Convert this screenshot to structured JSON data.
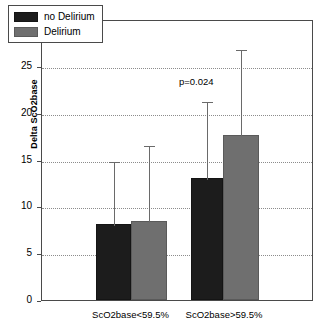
{
  "chart_data": {
    "type": "bar",
    "title": "",
    "xlabel": "",
    "ylabel": "Delta ScO2base",
    "ylim": [
      0,
      30
    ],
    "yticks": [
      0,
      5,
      10,
      15,
      20,
      25,
      30
    ],
    "grid": true,
    "legend_position": "top-left",
    "categories": [
      "ScO2base<59.5%",
      "ScO2base>59.5%"
    ],
    "series": [
      {
        "name": "no Delirium",
        "color": "#1c1c1c",
        "values": [
          8.1,
          13.0
        ],
        "errors_upper": [
          14.9,
          21.4
        ]
      },
      {
        "name": "Delirium",
        "color": "#6f6f6f",
        "values": [
          8.4,
          17.6
        ],
        "errors_upper": [
          16.7,
          26.9
        ]
      }
    ],
    "annotations": [
      {
        "text": "p=0.024",
        "x_category": "ScO2base>59.5%",
        "y": 23.5
      }
    ]
  },
  "axis": {
    "y_tick_labels": [
      "0",
      "5",
      "10",
      "15",
      "20",
      "25",
      "30"
    ],
    "y_title": "Delta ScO2base"
  },
  "legend": {
    "items": [
      {
        "label": "no Delirium",
        "swatch": "dark"
      },
      {
        "label": "Delirium",
        "swatch": "gray"
      }
    ]
  },
  "annotation": {
    "p_value": "p=0.024"
  }
}
